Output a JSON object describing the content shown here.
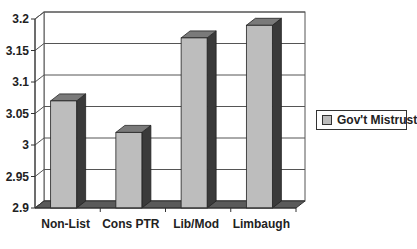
{
  "chart_data": {
    "type": "bar",
    "style": "3d-column",
    "title": "",
    "xlabel": "",
    "ylabel": "",
    "categories": [
      "Non-List",
      "Cons PTR",
      "Lib/Mod",
      "Limbaugh"
    ],
    "series": [
      {
        "name": "Gov't Mistrust",
        "values": [
          3.07,
          3.02,
          3.17,
          3.19
        ]
      }
    ],
    "ylim": [
      2.9,
      3.2
    ],
    "yticks": [
      2.9,
      2.95,
      3,
      3.05,
      3.1,
      3.15,
      3.2
    ],
    "ytick_labels": [
      "2.9",
      "2.95",
      "3",
      "3.05",
      "3.1",
      "3.15",
      "3.2"
    ],
    "grid": true,
    "legend_position": "right"
  },
  "legend": {
    "label": "Gov't Mistrust"
  },
  "colors": {
    "bar_front": "#bdbdbd",
    "bar_side": "#3a3a3a",
    "bar_top": "#7a7a7a",
    "floor": "#5a5a5a",
    "grid": "#555555"
  }
}
